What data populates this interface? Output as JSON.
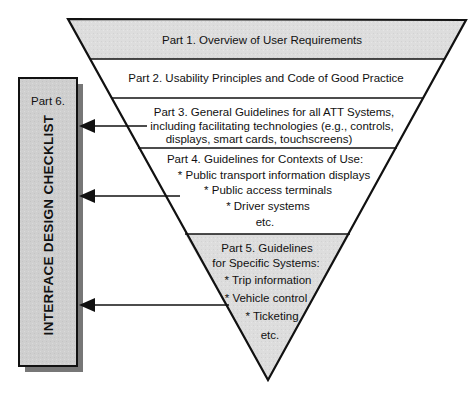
{
  "diagram": {
    "colors": {
      "gray_fill": "#dcdcdc",
      "white_fill": "#ffffff",
      "line": "#111111",
      "panel_fill": "#cfcfcf",
      "panel_shadow": "#777777"
    },
    "parts": [
      {
        "id": "part1",
        "fill": "gray",
        "lines": [
          "Part 1.  Overview of User Requirements"
        ]
      },
      {
        "id": "part2",
        "fill": "white",
        "lines": [
          "Part 2.  Usability Principles and Code of Good Practice"
        ]
      },
      {
        "id": "part3",
        "fill": "white",
        "lines": [
          "Part 3.  General Guidelines for all ATT Systems,",
          "including facilitating technologies (e.g., controls,",
          "displays, smart cards, touchscreens)"
        ]
      },
      {
        "id": "part4",
        "fill": "white",
        "lines": [
          "Part 4.  Guidelines for Contexts of Use:",
          "* Public transport information displays",
          "* Public access terminals",
          "* Driver systems",
          "etc."
        ]
      },
      {
        "id": "part5",
        "fill": "gray",
        "lines": [
          "Part 5.  Guidelines",
          "for Specific Systems:",
          "* Trip information",
          "* Vehicle control",
          "* Ticketing",
          "etc."
        ]
      }
    ],
    "side_panel": {
      "label": "Part 6.",
      "vertical_title": "INTERFACE DESIGN CHECKLIST"
    },
    "arrows": [
      {
        "from": "part3",
        "to": "side_panel"
      },
      {
        "from": "part4",
        "to": "side_panel"
      },
      {
        "from": "part5",
        "to": "side_panel"
      }
    ]
  }
}
